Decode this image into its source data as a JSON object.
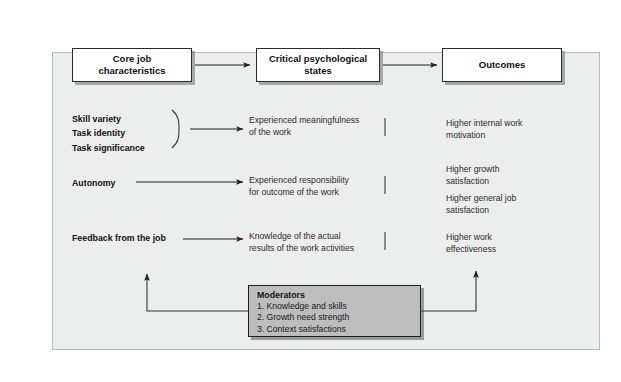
{
  "figure": {
    "background_color": "#ffffff",
    "panel_color": "#eceded",
    "panel_border_color": "#b9bbbb",
    "box_fill": "#ffffff",
    "box_border": "#2b2b2b",
    "moderators_fill": "#bdbdbd",
    "line_color": "#333333"
  },
  "headers": {
    "core": "Core job\ncharacteristics",
    "core_line1": "Core job",
    "core_line2": "characteristics",
    "critical": "Critical psychological\nstates",
    "critical_line1": "Critical psychological",
    "critical_line2": "states",
    "outcomes": "Outcomes"
  },
  "core_characteristics": {
    "trio": [
      "Skill variety",
      "Task identity",
      "Task significance"
    ],
    "autonomy": "Autonomy",
    "feedback": "Feedback from the job"
  },
  "psychological_states": {
    "meaningfulness_line1": "Experienced meaningfulness",
    "meaningfulness_line2": "of the work",
    "responsibility_line1": "Experienced responsibility",
    "responsibility_line2": "for outcome of the work",
    "knowledge_line1": "Knowledge of the actual",
    "knowledge_line2": "results of the work activities"
  },
  "outcomes": {
    "item1_line1": "Higher internal work",
    "item1_line2": "motivation",
    "item2_line1": "Higher growth",
    "item2_line2": "satisfaction",
    "item3_line1": "Higher general job",
    "item3_line2": "satisfaction",
    "item4_line1": "Higher work",
    "item4_line2": "effectiveness"
  },
  "moderators": {
    "title": "Moderators",
    "items": [
      "1. Knowledge and skills",
      "2. Growth need strength",
      "3. Context satisfactions"
    ]
  }
}
